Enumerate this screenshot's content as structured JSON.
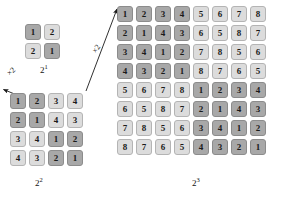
{
  "figure": {
    "background_color": "#ffffff",
    "dark_cell_color": "#a8a8a8",
    "light_cell_color": "#dcdcdc",
    "arrow_color": "#1a1a1a"
  },
  "grids": [
    {
      "id": "2e1",
      "caption_base": "2",
      "caption_exponent": "1",
      "order": 2,
      "dark_threshold": 1,
      "rows": [
        [
          1,
          2
        ],
        [
          2,
          1
        ]
      ]
    },
    {
      "id": "2e2",
      "caption_base": "2",
      "caption_exponent": "2",
      "order": 4,
      "dark_threshold": 2,
      "rows": [
        [
          1,
          2,
          3,
          4
        ],
        [
          2,
          1,
          4,
          3
        ],
        [
          3,
          4,
          1,
          2
        ],
        [
          4,
          3,
          2,
          1
        ]
      ]
    },
    {
      "id": "2e3",
      "caption_base": "2",
      "caption_exponent": "3",
      "order": 8,
      "dark_threshold": 4,
      "rows": [
        [
          1,
          2,
          3,
          4,
          5,
          6,
          7,
          8
        ],
        [
          2,
          1,
          4,
          3,
          6,
          5,
          8,
          7
        ],
        [
          3,
          4,
          1,
          2,
          7,
          8,
          5,
          6
        ],
        [
          4,
          3,
          2,
          1,
          8,
          7,
          6,
          5
        ],
        [
          5,
          6,
          7,
          8,
          1,
          2,
          3,
          4
        ],
        [
          6,
          5,
          8,
          7,
          2,
          1,
          4,
          3
        ],
        [
          7,
          8,
          5,
          6,
          3,
          4,
          1,
          2
        ],
        [
          8,
          7,
          6,
          5,
          4,
          3,
          2,
          1
        ]
      ]
    }
  ],
  "arrows": [
    {
      "id": "arrow-a",
      "label": "×2",
      "from_grid": "2e2",
      "to_grid": "2e1",
      "x1": 22,
      "y1": 97,
      "x2": 2,
      "y2": 89
    },
    {
      "id": "arrow-b",
      "label": "×2",
      "from_grid": "2e3",
      "to_grid": "2e2",
      "x1": 86,
      "y1": 91,
      "x2": 118,
      "y2": 8
    }
  ]
}
